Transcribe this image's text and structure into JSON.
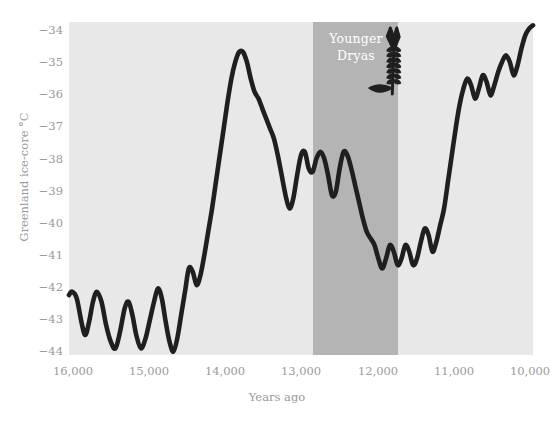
{
  "chart_data": {
    "type": "line",
    "title": "",
    "xlabel": "Years ago",
    "ylabel": "Greenland ice-core °C",
    "xlim": [
      16000,
      10000
    ],
    "ylim": [
      -44,
      -34
    ],
    "x_ticks": [
      "16,000",
      "15,000",
      "14,000",
      "13,000",
      "12,000",
      "11,000",
      "10,000"
    ],
    "x_tick_values": [
      16000,
      15000,
      14000,
      13000,
      12000,
      11000,
      10000
    ],
    "y_ticks": [
      "−34",
      "−35",
      "−36",
      "−37",
      "−38",
      "−39",
      "−40",
      "−41",
      "−42",
      "−43",
      "−44"
    ],
    "y_tick_values": [
      -34,
      -35,
      -36,
      -37,
      -38,
      -39,
      -40,
      -41,
      -42,
      -43,
      -44
    ],
    "grid": false,
    "legend": "none",
    "series": [
      {
        "name": "Greenland ice-core temperature",
        "color": "#1f1f1f",
        "x": [
          16000,
          15960,
          15900,
          15840,
          15790,
          15740,
          15690,
          15640,
          15580,
          15520,
          15460,
          15400,
          15340,
          15280,
          15230,
          15180,
          15130,
          15070,
          15010,
          14950,
          14900,
          14850,
          14800,
          14750,
          14700,
          14650,
          14600,
          14550,
          14500,
          14450,
          14400,
          14350,
          14300,
          14250,
          14200,
          14150,
          14100,
          14050,
          14000,
          13950,
          13900,
          13850,
          13800,
          13750,
          13700,
          13650,
          13600,
          13550,
          13500,
          13450,
          13400,
          13350,
          13300,
          13250,
          13200,
          13150,
          13100,
          13050,
          13000,
          12950,
          12900,
          12850,
          12800,
          12750,
          12700,
          12650,
          12600,
          12550,
          12500,
          12450,
          12400,
          12350,
          12300,
          12250,
          12200,
          12150,
          12100,
          12050,
          12000,
          11950,
          11900,
          11850,
          11800,
          11750,
          11700,
          11650,
          11600,
          11550,
          11500,
          11450,
          11400,
          11350,
          11300,
          11250,
          11200,
          11150,
          11100,
          11050,
          11000,
          10950,
          10900,
          10850,
          10800,
          10750,
          10700,
          10650,
          10600,
          10550,
          10500,
          10450,
          10400,
          10350,
          10300,
          10250,
          10200,
          10150,
          10100,
          10050,
          10000
        ],
        "y": [
          -42.2,
          -42.1,
          -42.3,
          -43.0,
          -43.4,
          -43.0,
          -42.4,
          -42.1,
          -42.4,
          -43.1,
          -43.6,
          -43.8,
          -43.3,
          -42.6,
          -42.4,
          -42.8,
          -43.4,
          -43.8,
          -43.5,
          -42.9,
          -42.4,
          -42.0,
          -42.3,
          -43.0,
          -43.6,
          -43.9,
          -43.5,
          -42.8,
          -42.1,
          -41.4,
          -41.5,
          -41.9,
          -41.6,
          -41.0,
          -40.3,
          -39.6,
          -38.8,
          -38.0,
          -37.2,
          -36.4,
          -35.7,
          -35.2,
          -34.9,
          -34.9,
          -35.2,
          -35.7,
          -36.1,
          -36.3,
          -36.6,
          -36.9,
          -37.2,
          -37.5,
          -38.0,
          -38.6,
          -39.2,
          -39.6,
          -39.3,
          -38.6,
          -38.0,
          -37.9,
          -38.4,
          -38.5,
          -38.1,
          -37.9,
          -38.1,
          -38.6,
          -39.2,
          -39.1,
          -38.4,
          -37.9,
          -38.0,
          -38.4,
          -38.9,
          -39.4,
          -39.9,
          -40.3,
          -40.5,
          -40.7,
          -41.1,
          -41.4,
          -41.1,
          -40.7,
          -40.9,
          -41.3,
          -41.1,
          -40.7,
          -40.9,
          -41.3,
          -41.1,
          -40.6,
          -40.2,
          -40.4,
          -40.9,
          -40.6,
          -40.1,
          -39.6,
          -38.8,
          -38.0,
          -37.2,
          -36.5,
          -36.0,
          -35.7,
          -35.9,
          -36.3,
          -36.0,
          -35.6,
          -35.8,
          -36.2,
          -35.9,
          -35.5,
          -35.2,
          -35.0,
          -35.2,
          -35.6,
          -35.3,
          -34.8,
          -34.4,
          -34.2,
          -34.1
        ]
      }
    ],
    "shaded_regions": [
      {
        "name": "Younger Dryas",
        "label": "Younger\nDryas",
        "label_lines": [
          "Younger",
          "Dryas"
        ],
        "x_start": 12850,
        "x_end": 11730,
        "color": "#b4b4b4"
      }
    ],
    "annotations": [
      {
        "name": "wheat-stalk-icon",
        "description": "wheat / grain stalk illustration",
        "x": 11800,
        "y": -34.6
      }
    ],
    "plot_background": "#e8e8e8",
    "page_background": "#ffffff",
    "tick_color": "#9a9a9a",
    "band_label_color": "#ffffff"
  }
}
